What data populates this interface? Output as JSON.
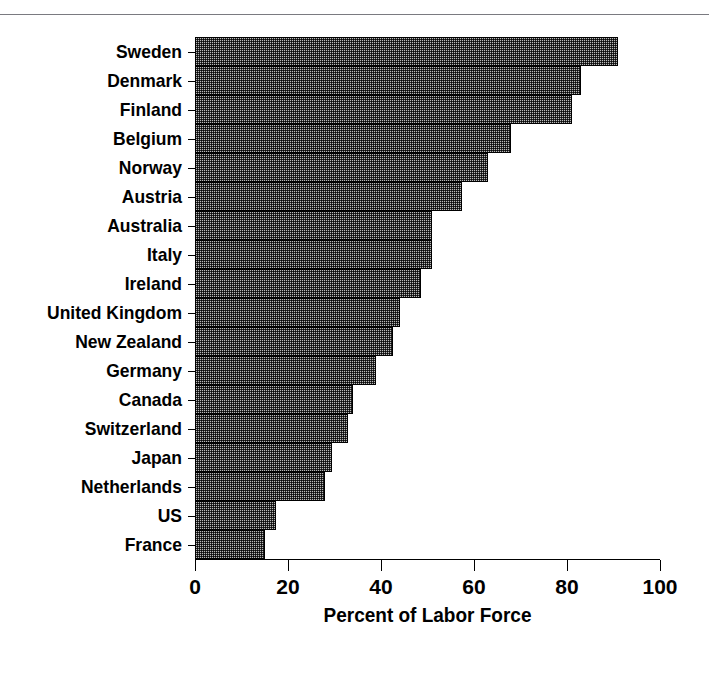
{
  "page": {
    "ghost_caption": "",
    "background_color": "#ffffff"
  },
  "chart_data": {
    "type": "bar",
    "orientation": "horizontal",
    "title": "",
    "xlabel": "Percent of Labor Force",
    "ylabel": "",
    "xlim": [
      0,
      100
    ],
    "xticks": [
      0,
      20,
      40,
      60,
      80,
      100
    ],
    "xtick_labels": [
      "0",
      "20",
      "40",
      "60",
      "80",
      "100"
    ],
    "grid": false,
    "legend": null,
    "bar_fill_color": "#b9b9b9",
    "bar_edge_color": "#000000",
    "bar_fill_pattern": "fine-checkerboard-dither",
    "categories": [
      "Sweden",
      "Denmark",
      "Finland",
      "Belgium",
      "Norway",
      "Austria",
      "Australia",
      "Italy",
      "Ireland",
      "United Kingdom",
      "New Zealand",
      "Germany",
      "Canada",
      "Switzerland",
      "Japan",
      "Netherlands",
      "US",
      "France"
    ],
    "values": [
      91,
      83,
      81,
      68,
      63,
      57.5,
      51,
      51,
      48.5,
      44,
      42.5,
      39,
      34,
      33,
      29.5,
      28,
      17.5,
      15
    ]
  }
}
